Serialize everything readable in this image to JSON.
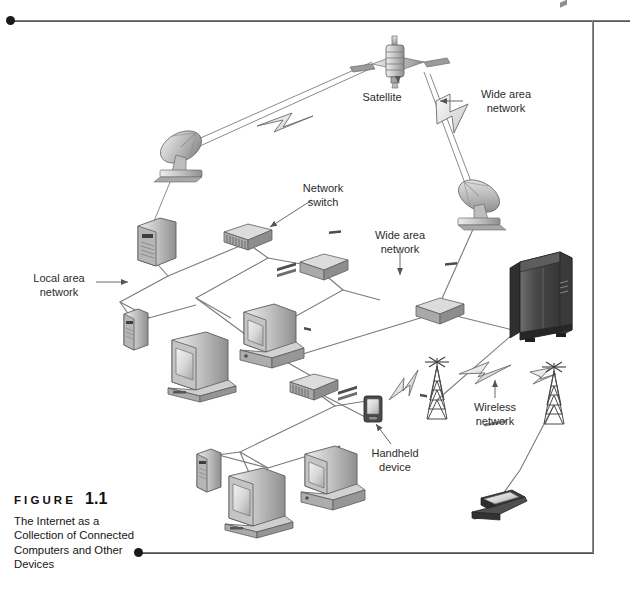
{
  "figure": {
    "label_word": "FIGURE",
    "number": "1.1",
    "caption": "The Internet as a Collection of Connected Computers and Other Devices"
  },
  "diagram": {
    "title": "The Internet as a Collection of Connected Computers and Other Devices",
    "annotations": [
      {
        "id": "satellite",
        "text": "Satellite",
        "x": 378,
        "y": 92,
        "align": "center"
      },
      {
        "id": "wan-top",
        "text": "Wide area\nnetwork",
        "x": 505,
        "y": 94,
        "align": "center"
      },
      {
        "id": "network-switch",
        "text": "Network\nswitch",
        "x": 322,
        "y": 188,
        "align": "center"
      },
      {
        "id": "wan-middle",
        "text": "Wide area\nnetwork",
        "x": 400,
        "y": 234,
        "align": "center"
      },
      {
        "id": "local-area-network",
        "text": "Local area\nnetwork",
        "x": 60,
        "y": 277,
        "align": "center"
      },
      {
        "id": "wireless-network",
        "text": "Wireless\nnetwork",
        "x": 495,
        "y": 405,
        "align": "center"
      },
      {
        "id": "handheld-device",
        "text": "Handheld\ndevice",
        "x": 395,
        "y": 452,
        "align": "center"
      }
    ],
    "nodes": [
      {
        "id": "satellite",
        "type": "satellite",
        "x": 398,
        "y": 62
      },
      {
        "id": "dish-left",
        "type": "satellite-dish",
        "x": 180,
        "y": 152
      },
      {
        "id": "dish-right",
        "type": "satellite-dish",
        "x": 478,
        "y": 200
      },
      {
        "id": "server-1",
        "type": "server-tower",
        "x": 152,
        "y": 240
      },
      {
        "id": "switch-1",
        "type": "network-switch",
        "x": 247,
        "y": 233
      },
      {
        "id": "switch-2",
        "type": "network-switch",
        "x": 323,
        "y": 263
      },
      {
        "id": "router-1",
        "type": "network-switch",
        "x": 440,
        "y": 308
      },
      {
        "id": "switch-3",
        "type": "network-switch",
        "x": 313,
        "y": 383
      },
      {
        "id": "mini-tower-1",
        "type": "mini-tower",
        "x": 134,
        "y": 330
      },
      {
        "id": "desktop-1",
        "type": "desktop-crt",
        "x": 196,
        "y": 364
      },
      {
        "id": "desktop-2",
        "type": "desktop-pc",
        "x": 266,
        "y": 335
      },
      {
        "id": "mainframe",
        "type": "mainframe",
        "x": 538,
        "y": 290
      },
      {
        "id": "tower-pc-1",
        "type": "mini-tower",
        "x": 207,
        "y": 470
      },
      {
        "id": "desktop-3",
        "type": "desktop-crt",
        "x": 253,
        "y": 499
      },
      {
        "id": "desktop-4",
        "type": "desktop-pc",
        "x": 327,
        "y": 477
      },
      {
        "id": "handheld",
        "type": "handheld-device",
        "x": 373,
        "y": 409
      },
      {
        "id": "radio-tower-1",
        "type": "radio-tower",
        "x": 437,
        "y": 385
      },
      {
        "id": "radio-tower-2",
        "type": "radio-tower",
        "x": 554,
        "y": 390
      },
      {
        "id": "laptop",
        "type": "laptop",
        "x": 498,
        "y": 513
      }
    ],
    "link_types": [
      "wired-line",
      "wireless-bolt",
      "dish-beam"
    ],
    "colors": {
      "line": "#6e6e6e",
      "label_text": "#2b2b2b",
      "device_light": "#cfcfcf",
      "device_mid": "#9a9a9a",
      "device_dark": "#5c5c5c",
      "mainframe": "#4a4a4a",
      "frame_rule": "#555555",
      "dot": "#1a1a1a"
    }
  }
}
